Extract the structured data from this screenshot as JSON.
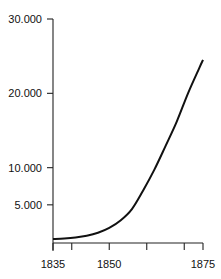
{
  "chart_data": {
    "type": "line",
    "title": "",
    "xlabel": "",
    "ylabel": "",
    "xlim": [
      1835,
      1875
    ],
    "ylim": [
      0,
      30000
    ],
    "x_ticks": [
      1835,
      1840,
      1850,
      1860,
      1870,
      1875
    ],
    "x_tick_labels": [
      {
        "value": 1835,
        "label": "1835"
      },
      {
        "value": 1850,
        "label": "1850"
      },
      {
        "value": 1875,
        "label": "1875"
      }
    ],
    "y_ticks": [
      {
        "value": 5000,
        "label": "5.000"
      },
      {
        "value": 10000,
        "label": "10.000"
      },
      {
        "value": 20000,
        "label": "20.000"
      },
      {
        "value": 30000,
        "label": "30.000"
      }
    ],
    "grid": false,
    "legend": "none",
    "series": [
      {
        "name": "growth",
        "x": [
          1835,
          1838,
          1841,
          1844,
          1847,
          1850,
          1853,
          1856,
          1859,
          1862,
          1865,
          1868,
          1871,
          1874,
          1875
        ],
        "values": [
          400,
          480,
          620,
          850,
          1250,
          1900,
          2900,
          4400,
          6900,
          9700,
          12900,
          16200,
          20000,
          23400,
          24500
        ]
      }
    ]
  }
}
